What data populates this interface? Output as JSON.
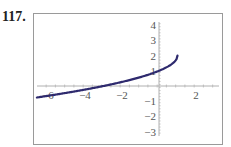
{
  "problem_number": "117.",
  "chart_data": {
    "type": "line",
    "title": "",
    "xlabel": "",
    "ylabel": "",
    "xlim": [
      -6.6,
      3.4
    ],
    "ylim": [
      -3.6,
      4.5
    ],
    "x_ticks": [
      -6,
      -4,
      -2,
      2
    ],
    "x_tick_labels": [
      "-6",
      "-4",
      "-2",
      "2"
    ],
    "y_ticks": [
      4,
      3,
      2,
      1,
      -1,
      -2,
      -3
    ],
    "y_tick_labels": [
      "4",
      "3",
      "2",
      "1",
      "-1",
      "-2",
      "-3"
    ],
    "grid": false,
    "legend": null,
    "series": [
      {
        "name": "y = 2 - sqrt(1 - x)",
        "color": "#2e2a6e",
        "x": [
          -6.6,
          -6,
          -5,
          -4,
          -3,
          -2,
          -1,
          0,
          0.5,
          0.8,
          0.95,
          1
        ],
        "values": [
          -0.76,
          -0.65,
          -0.45,
          -0.24,
          0,
          0.27,
          0.59,
          1,
          1.29,
          1.55,
          1.78,
          2
        ]
      }
    ]
  },
  "colors": {
    "curve": "#2e2a6e",
    "axis": "#b0b0b0",
    "frame": "#9a9a9a",
    "label": "#555555"
  }
}
